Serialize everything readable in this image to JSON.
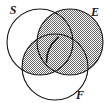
{
  "figure": {
    "type": "venn-diagram",
    "background_color": "#ffffff",
    "outline_color": "#1a1a1a",
    "shade_color": "#808080",
    "shade_pattern": "checkerboard-dither-50",
    "sets": [
      {
        "id": "S",
        "label": "S",
        "label_x": 13,
        "label_y": 14,
        "circle_cx": 40,
        "circle_cy": 42,
        "circle_r": 33
      },
      {
        "id": "E",
        "label": "E",
        "label_x": 95,
        "label_y": 16,
        "circle_cx": 70,
        "circle_cy": 42,
        "circle_r": 33
      },
      {
        "id": "F",
        "label": "F",
        "label_x": 80,
        "label_y": 99,
        "circle_cx": 55,
        "circle_cy": 67,
        "circle_r": 33
      }
    ],
    "shaded_regions": [
      "E",
      "E-and-S",
      "E-and-F",
      "E-and-S-and-F",
      "S-and-F"
    ],
    "unshaded_regions": [
      "S-only",
      "F-only"
    ]
  }
}
